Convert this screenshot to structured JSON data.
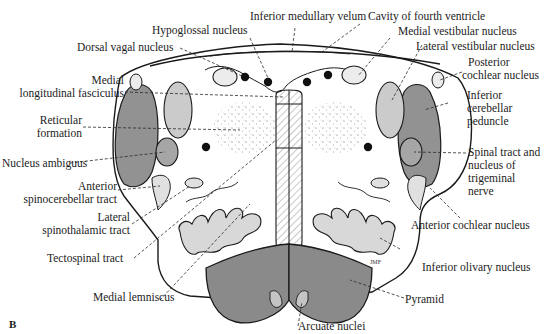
{
  "figure": {
    "panel_label": "B",
    "signature": "JMF",
    "colors": {
      "outline": "#1a1a1a",
      "dark_fill": "#8c8c8c",
      "medium_fill": "#a9a9a9",
      "light_fill": "#d6d6d6",
      "background": "#ffffff"
    }
  },
  "labels": {
    "inferior_medullary_velum": "Inferior medullary velum",
    "cavity_fourth_ventricle": "Cavity of fourth ventricle",
    "hypoglossal_nucleus": "Hypoglossal nucleus",
    "medial_vestibular_nucleus": "Medial vestibular nucleus",
    "dorsal_vagal_nucleus": "Dorsal vagal nucleus",
    "lateral_vestibular_nucleus": "Lateral vestibular nucleus",
    "posterior_cochlear_nucleus_1": "Posterior",
    "posterior_cochlear_nucleus_2": "cochlear nucleus",
    "mlf_1": "Medial",
    "mlf_2": "longitudinal fasciculus",
    "inferior_cerebellar_peduncle_1": "Inferior",
    "inferior_cerebellar_peduncle_2": "cerebellar",
    "inferior_cerebellar_peduncle_3": "peduncle",
    "reticular_formation_1": "Reticular",
    "reticular_formation_2": "formation",
    "nucleus_ambiguus": "Nucleus ambiguus",
    "spinal_trigeminal_1": "Spinal tract and",
    "spinal_trigeminal_2": "nucleus of",
    "spinal_trigeminal_3": "trigeminal",
    "spinal_trigeminal_4": "nerve",
    "anterior_spinocerebellar_1": "Anterior",
    "anterior_spinocerebellar_2": "spinocerebellar tract",
    "lateral_spinothalamic_1": "Lateral",
    "lateral_spinothalamic_2": "spinothalamic tract",
    "anterior_cochlear_nucleus": "Anterior cochlear nucleus",
    "tectospinal_tract": "Tectospinal tract",
    "inferior_olivary_nucleus": "Inferior olivary nucleus",
    "medial_lemniscus": "Medial lemniscus",
    "pyramid": "Pyramid",
    "arcuate_nuclei": "Arcuate nuclei"
  }
}
